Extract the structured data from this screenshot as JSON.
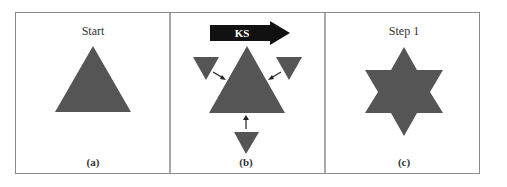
{
  "figure": {
    "panels": [
      {
        "id": "a",
        "title": "Start",
        "caption": "(a)",
        "shape": "triangle"
      },
      {
        "id": "b",
        "title": "",
        "caption": "(b)",
        "arrow_label": "KS",
        "shape": "triangle-with-three-small-triangles-attaching"
      },
      {
        "id": "c",
        "title": "Step 1",
        "caption": "(c)",
        "shape": "six-pointed-star"
      }
    ],
    "colors": {
      "shape_fill": "#555555",
      "border": "#8a8a8a",
      "arrow_fill": "#111111",
      "arrow_text": "#ffffff"
    }
  }
}
